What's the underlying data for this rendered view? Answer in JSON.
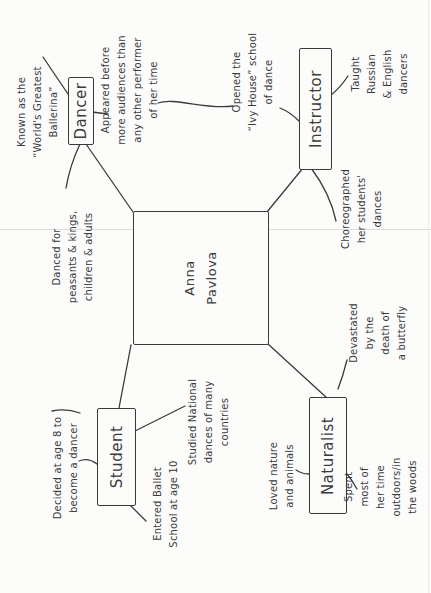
{
  "map": {
    "type": "concept-map",
    "subject": "Anna Pavlova",
    "center_label": "Anna\nPavlova",
    "ink_color": "#3b3b3b",
    "paper_color": "#fcfcfb",
    "nodes": {
      "dancer": {
        "label": "Dancer",
        "notes": {
          "known": "Known as the\n“World's Greatest\nBallerina”",
          "appeared": "Appeared before\nmore audiences than\nany other performer\nof her time",
          "danced": "Danced for\npeasants & kings,\nchildren & adults"
        }
      },
      "instructor": {
        "label": "Instructor",
        "notes": {
          "opened": "Opened the\n“Ivy House” school\nof dance",
          "taught": "Taught\nRussian & English\ndancers",
          "choreographed": "Choreographed\nher students'\ndances"
        }
      },
      "student": {
        "label": "Student",
        "notes": {
          "decided": "Decided at age 8 to\nbecome a dancer",
          "entered": "Entered Ballet\nSchool at age 10",
          "studied": "Studied National\ndances of many\ncountries"
        }
      },
      "naturalist": {
        "label": "Naturalist",
        "notes": {
          "loved": "Loved nature\nand animals",
          "spent": "Spent most of\nher time outdoors/in\nthe woods",
          "devastated": "Devastated\nby the\ndeath of\na butterfly"
        }
      }
    }
  }
}
